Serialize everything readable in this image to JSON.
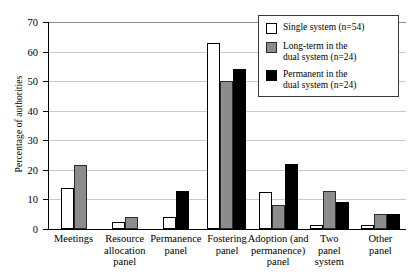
{
  "chart_data": {
    "type": "bar",
    "title": "",
    "xlabel": "",
    "ylabel": "Percentage of authorities",
    "ylim": [
      0,
      70
    ],
    "ytick_step": 10,
    "yticks": [
      0,
      10,
      20,
      30,
      40,
      50,
      60,
      70
    ],
    "grid": true,
    "legend_position": "top-right",
    "categories": [
      "Meetings",
      "Resource\nallocation\npanel",
      "Permanence\npanel",
      "Fostering\npanel",
      "Adoption (and\npermanence)\npanel",
      "Two\npanel\nsystem",
      "Other\npanel"
    ],
    "series": [
      {
        "name": "Single system (n=54)",
        "color": "#ffffff",
        "values": [
          14,
          2.5,
          4,
          63,
          12.5,
          1.5,
          1.5
        ]
      },
      {
        "name": "Long-term in the\ndual system (n=24)",
        "color": "#8c8c8c",
        "values": [
          21.5,
          4,
          0,
          50,
          8,
          13,
          5
        ]
      },
      {
        "name": "Permanent in the\ndual system (n=24)",
        "color": "#000000",
        "values": [
          0,
          0,
          12.8,
          54,
          22,
          9,
          5
        ]
      }
    ]
  },
  "legend": {
    "items": [
      {
        "label": "Single system (n=54)",
        "swatch": "single"
      },
      {
        "label": "Long-term in the\ndual system (n=24)",
        "swatch": "longterm"
      },
      {
        "label": "Permanent in the\ndual system (n=24)",
        "swatch": "permanent"
      }
    ]
  }
}
